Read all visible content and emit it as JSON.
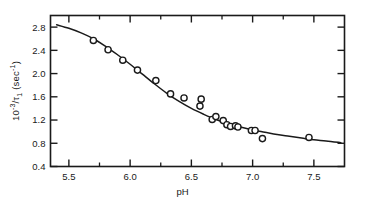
{
  "figure": {
    "background_color": "#ffffff",
    "ink_color": "#1a1a1a",
    "marker_style": "open-circle"
  },
  "axis_titles": {
    "y_prefix": "10",
    "y_exponent": "-3",
    "y_mid": "/τ",
    "y_sub": "1",
    "y_suffix": " (sec",
    "y_suffix_exponent": "-1",
    "y_close": ")",
    "y_full": "10-3/τ1 (sec-1)",
    "x": "pH"
  },
  "chart_data": {
    "type": "scatter",
    "title": "",
    "xlabel": "pH",
    "ylabel": "10^-3/τ₁ (sec^-1)",
    "xlim": [
      5.35,
      7.75
    ],
    "ylim": [
      0.4,
      3.0
    ],
    "grid": false,
    "legend": false,
    "legend_position": "none",
    "x_major_ticks": [
      5.5,
      6.0,
      6.5,
      7.0,
      7.5
    ],
    "x_major_tick_labels": [
      "5.5",
      "6.0",
      "6.5",
      "7.0",
      "7.5"
    ],
    "x_minor_ticks": [
      5.75,
      6.25,
      6.75,
      7.25
    ],
    "y_major_ticks": [
      0.4,
      0.8,
      1.2,
      1.6,
      2.0,
      2.4,
      2.8
    ],
    "y_major_tick_labels": [
      "0.4",
      "0.8",
      "1.2",
      "1.6",
      "2.0",
      "2.4",
      "2.8"
    ],
    "ticks_direction": "in",
    "frame": "box",
    "series": [
      {
        "name": "data",
        "marker": "open-circle",
        "x": [
          5.7,
          5.82,
          5.94,
          6.06,
          6.21,
          6.33,
          6.44,
          6.57,
          6.58,
          6.67,
          6.7,
          6.76,
          6.79,
          6.82,
          6.86,
          6.88,
          6.99,
          7.02,
          7.08,
          7.46
        ],
        "y": [
          2.57,
          2.41,
          2.23,
          2.06,
          1.88,
          1.65,
          1.58,
          1.44,
          1.56,
          1.21,
          1.26,
          1.19,
          1.12,
          1.09,
          1.1,
          1.08,
          1.02,
          1.02,
          0.88,
          0.9
        ]
      },
      {
        "name": "fitted-curve",
        "marker": "none",
        "line": "solid",
        "x": [
          5.4,
          5.5,
          5.6,
          5.7,
          5.8,
          5.9,
          6.0,
          6.1,
          6.2,
          6.3,
          6.4,
          6.5,
          6.6,
          6.7,
          6.8,
          6.9,
          7.0,
          7.1,
          7.2,
          7.3,
          7.4,
          7.5,
          7.6,
          7.72
        ],
        "y": [
          2.84,
          2.78,
          2.7,
          2.6,
          2.47,
          2.32,
          2.16,
          1.99,
          1.82,
          1.66,
          1.52,
          1.4,
          1.3,
          1.21,
          1.14,
          1.08,
          1.03,
          0.99,
          0.95,
          0.92,
          0.89,
          0.86,
          0.84,
          0.81
        ]
      }
    ]
  }
}
